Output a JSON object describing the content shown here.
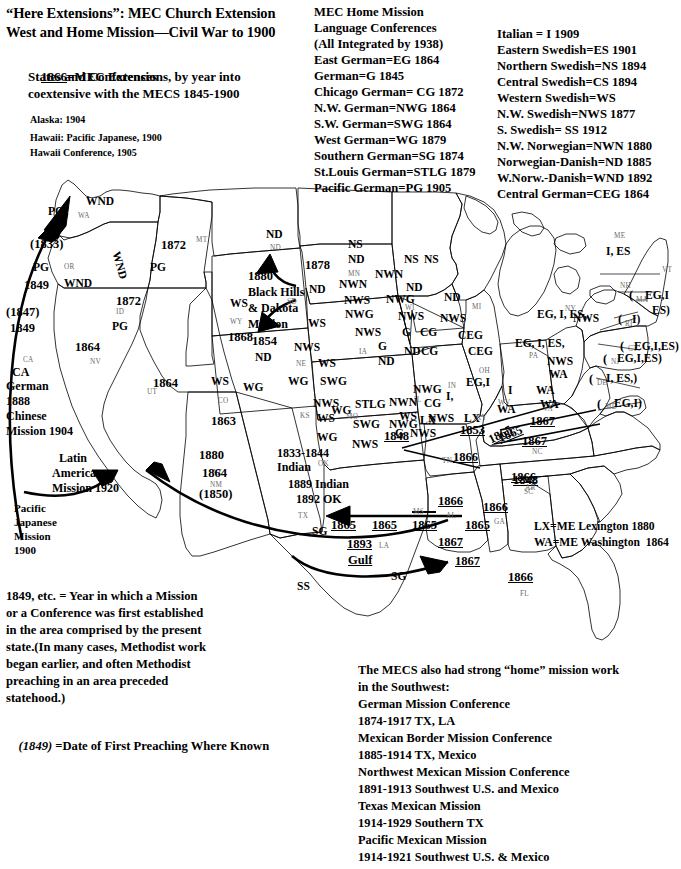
{
  "title": {
    "line1": "“Here Extensions”: MEC Church Extension",
    "line2": "West and Home Mission—Civil War to 1900"
  },
  "legend": {
    "key_year": "1866",
    "key_text": "=MEC Extensions, by year into",
    "line2": "States and Conferences",
    "line3": "coextensive with the MECS 1845-1900",
    "alaska": "Alaska: 1904",
    "hawaii1": "Hawaii: Pacific Japanese, 1900",
    "hawaii2": "Hawaii Conference, 1905"
  },
  "middle_column": {
    "heading1": "MEC Home Mission",
    "heading2": "Language Conferences",
    "heading3": "(All Integrated by 1938)",
    "items": [
      "East German=EG 1864",
      "German=G 1845",
      "Chicago German= CG 1872",
      "N.W. German=NWG 1864",
      "S.W. German=SWG 1864",
      "West German=WG 1879",
      "Southern German=SG 1874",
      "St.Louis German=STLG 1879",
      "Pacific German=PG 1905"
    ]
  },
  "right_column": {
    "items": [
      "Italian = I 1909",
      "Eastern Swedish=ES 1901",
      "Northern Swedish=NS 1894",
      "Central Swedish=CS 1894",
      "Western Swedish=WS",
      "N.W. Swedish=NWS 1877",
      "S. Swedish= SS 1912",
      "N.W. Norwegian=NWN 1880",
      "Norwegian-Danish=ND 1885",
      "W.Norw.-Danish=WND 1892",
      "Central German=CEG 1864"
    ]
  },
  "map_key": {
    "lx": "LX=ME Lexington 1880",
    "wa": "WA=ME Washington  1864"
  },
  "bottom_note": {
    "lines": [
      "1849, etc. = Year in which a Mission",
      "or a Conference was first established",
      "in the area comprised by the present",
      "state.(In many cases, Methodist work",
      "began earlier, and often Methodist",
      "preaching in an area preceded",
      "statehood.)"
    ],
    "first_preaching_a": "(1849)",
    "first_preaching_b": " =Date of First Preaching Where Known"
  },
  "mecs_note": {
    "lines": [
      "The MECS also had strong “home” mission work",
      "in the Southwest:",
      "German Mission Conference",
      "1874-1917 TX, LA",
      "Mexican Border Mission Conference",
      "1885-1914 TX, Mexico",
      "Northwest Mexican Mission Conference",
      "1891-1913 Southwest U.S. and Mexico",
      "Texas Mexican Mission",
      "1914-1929 Southern TX",
      "Pacific Mexican Mission",
      "1914-1921 Southwest U.S. & Mexico"
    ]
  },
  "map_labels": {
    "wa_pg": "PG",
    "wa_wnd": "WND",
    "wa_abbr": "WA",
    "id_wnd_rot": "WND",
    "id_1872": "1872",
    "id_pg": "PG",
    "id_abbr": "ID",
    "or_1833": "(1833)",
    "or_pg": "PG",
    "or_1849": "1849",
    "or_wnd": "WND",
    "or_abbr": "OR",
    "ca_1847": "(1847)",
    "ca_1849": "1849",
    "ca_abbr": "CA",
    "ca_label": "CA",
    "ca_german": "German",
    "ca_1888": "1888",
    "ca_chinese": "Chinese",
    "ca_mission1904": "Mission 1904",
    "nv_1864": "1864",
    "nv_abbr": "NV",
    "ut_1864": "1864",
    "ut_abbr": "UT",
    "ut_ws": "WS",
    "mt_1872": "1872",
    "mt_abbr": "MT",
    "mt_pg": "PG",
    "wy_ws": "WS",
    "wy_abbr": "WY",
    "wy_1868": "1868",
    "co_ws": "WS",
    "co_wg": "WG",
    "co_abbr": "CO",
    "co_1863": "1863",
    "az_1880": "1880",
    "az_abbr": "AZ",
    "az_latin1": "Latin",
    "az_latin2": "American",
    "az_latin3": "Mission 1920",
    "nm_1864": "1864",
    "nm_abbr": "NM",
    "nm_1850": "(1850)",
    "pacific_jp": "Pacific\nJapanese\nMission\n1900",
    "nd_nd1": "ND",
    "nd_abbr": "ND",
    "nd_1878": "1878",
    "sd_1880": "1880",
    "sd_blackhills1": "Black Hills",
    "sd_blackhills2": "& Dakota",
    "sd_blackhills3": "Mission",
    "sd_abbr": "SD",
    "sd_nd": "ND",
    "sd_ws": "WS",
    "ne_1854": "1854",
    "ne_nd": "ND",
    "ne_nws": "NWS",
    "ne_ws": "WS",
    "ne_wg": "WG",
    "ne_swg": "SWG",
    "ne_abbr": "NE",
    "ks_nws": "NWS",
    "ks_ws": "WS",
    "ks_wg": "WG",
    "ks_abbr": "KS",
    "mn_ns": "NS",
    "mn_nd": "ND",
    "mn_nwn": "NWN",
    "mn_nws": "NWS",
    "mn_nwg": "NWG",
    "mn_abbr": "MN",
    "ia_nws": "NWS",
    "ia_g": "G",
    "ia_nd": "ND",
    "ia_abbr": "IA",
    "mo_wg": "WG",
    "mo_swg": "SWG",
    "mo_nws": "NWS",
    "mo_stlg": "STLG",
    "mo_abbr": "MO",
    "mo_1848": "1848",
    "wi_ns": "NS",
    "wi_nwn": "NWN",
    "wi_nd": "ND",
    "wi_nwg": "NWG",
    "wi_nws": "NWS",
    "wi_abbr": "WI",
    "il_g": "G",
    "il_cg": "CG",
    "il_nd": "ND",
    "il_swg": "SWG",
    "il_nwg": "NWG",
    "il_ws": "WS",
    "il_g2": "G",
    "il_nws": "NWS",
    "il_abbr": "IL",
    "mi_ns": "NS",
    "mi_nd": "ND",
    "mi_nws": "NWS",
    "mi_abbr": "MI",
    "in_cg": "CG",
    "in_nwg": "NWG",
    "in_nwn": "NWN",
    "in_i": "I,",
    "in_nws": "NWS",
    "in_lx": "LX",
    "in_abbr": "IN",
    "oh_ceg": "CEG",
    "oh_egi": "EG,I",
    "oh_abbr": "OH",
    "ky_1853": "1853",
    "ky_lx": "LX",
    "ky_abbr": "KY",
    "tn_1866": "1866",
    "tn_abbr": "TN",
    "tn_1865": "1865",
    "ar_1848": "1848",
    "ar_abbr": "AR",
    "ok_1833": "1833-1844",
    "ok_indian": "Indian",
    "ok_1889": "1889 Indian",
    "ok_1892": "1892 OK",
    "ok_abbr": "OK",
    "tx_abbr": "TX",
    "tx_sg": "SG",
    "tx_ss": "SS",
    "tx_1865": "1865",
    "la_1865": "1865",
    "la_abbr": "LA",
    "la_1893": "1893",
    "la_gulf": "Gulf",
    "la_sg": "SG",
    "ms_1865": "1865",
    "ms_abbr": "MS",
    "al_1866": "1866",
    "al_abbr": "AL",
    "al_1867": "1867",
    "ga_1866": "1866",
    "ga_abbr": "GA",
    "fl_1866": "1866",
    "fl_abbr": "FL",
    "sc_1866": "1866",
    "sc_abbr": "SC",
    "nc_1867": "1867",
    "nc_abbr": "NC",
    "va_1867": "1867",
    "va_abbr": "VA",
    "wv_i": "I",
    "wv_wa": "WA",
    "wv_abbr": "WV",
    "md_wa": "WA",
    "md_wa2": "WA",
    "pa_egies": "EG, I, ES,",
    "pa_nws": "NWS",
    "pa_abbr": "PA",
    "ny_egies": "EG, I, ES,",
    "ny_nws": "NWS",
    "ny_abbr": "NY",
    "me_abbr": "ME",
    "me_ies": "I, ES",
    "vt_abbr": "VT",
    "nh_abbr": "NH",
    "ma_paren": "(",
    "ma_abbr": "MA",
    "ma_egi": "EG,I",
    "ma_es": "ES)",
    "ri_paren": "(",
    "ri_abbr": "RI",
    "ri_i": "I)",
    "ct_paren": "(",
    "ct_abbr": "CT",
    "ct_egies": "EG,I,ES)",
    "nj_paren": "(",
    "nj_abbr": "NJ",
    "nj_egies": "EG,I,ES)",
    "de_paren": "(",
    "de_abbr": "DE",
    "de_ies": "I, ES,)",
    "md_paren": "(",
    "md_abbr": "MD",
    "md_egi": "EG,I)"
  }
}
